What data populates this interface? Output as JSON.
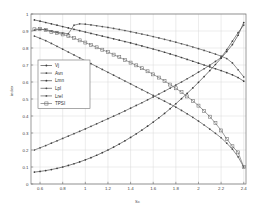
{
  "chart_data": {
    "type": "line",
    "title": "",
    "xlabel": "Sc",
    "ylabel": "index",
    "xlim": [
      0.52,
      2.42
    ],
    "ylim": [
      0,
      1
    ],
    "xticks": [
      0.6,
      0.8,
      1.0,
      1.2,
      1.4,
      1.6,
      1.8,
      2.0,
      2.2,
      2.4
    ],
    "xticklabels": [
      "0.6",
      "0.8",
      "1",
      "1.2",
      "1.4",
      "1.6",
      "1.8",
      "2",
      "2.2",
      "2.4"
    ],
    "yticks": [
      0,
      0.1,
      0.2,
      0.3,
      0.4,
      0.5,
      0.6,
      0.7,
      0.8,
      0.9,
      1
    ],
    "yticklabels": [
      "0",
      "0.1",
      "0.2",
      "0.3",
      "0.4",
      "0.5",
      "0.6",
      "0.7",
      "0.8",
      "0.9",
      "1"
    ],
    "grid": true,
    "legend_position": "upper-left-inside",
    "x": [
      0.55,
      0.6,
      0.65,
      0.7,
      0.75,
      0.8,
      0.85,
      0.9,
      0.95,
      1.0,
      1.05,
      1.1,
      1.15,
      1.2,
      1.25,
      1.3,
      1.35,
      1.4,
      1.45,
      1.5,
      1.55,
      1.6,
      1.65,
      1.7,
      1.75,
      1.8,
      1.85,
      1.9,
      1.95,
      2.0,
      2.05,
      2.1,
      2.15,
      2.2,
      2.25,
      2.3,
      2.35,
      2.4
    ],
    "series": [
      {
        "name": "Vj",
        "marker": "dot",
        "color": "#3a3a3a",
        "values": [
          0.965,
          0.958,
          0.95,
          0.942,
          0.934,
          0.926,
          0.918,
          0.91,
          0.902,
          0.894,
          0.886,
          0.878,
          0.87,
          0.862,
          0.854,
          0.846,
          0.838,
          0.83,
          0.821,
          0.812,
          0.803,
          0.794,
          0.785,
          0.775,
          0.765,
          0.755,
          0.744,
          0.733,
          0.722,
          0.711,
          0.7,
          0.689,
          0.678,
          0.667,
          0.655,
          0.642,
          0.626,
          0.605
        ]
      },
      {
        "name": "Avn",
        "marker": "dot",
        "color": "#4a4a4a",
        "values": [
          0.87,
          0.857,
          0.843,
          0.827,
          0.81,
          0.793,
          0.776,
          0.759,
          0.742,
          0.725,
          0.708,
          0.691,
          0.674,
          0.657,
          0.64,
          0.623,
          0.606,
          0.589,
          0.572,
          0.555,
          0.538,
          0.521,
          0.504,
          0.487,
          0.47,
          0.452,
          0.433,
          0.413,
          0.392,
          0.37,
          0.347,
          0.323,
          0.298,
          0.272,
          0.24,
          0.205,
          0.16,
          0.1
        ]
      },
      {
        "name": "Lmn",
        "marker": "dot",
        "color": "#3a3a3a",
        "values": [
          0.07,
          0.074,
          0.079,
          0.085,
          0.092,
          0.1,
          0.109,
          0.119,
          0.13,
          0.142,
          0.155,
          0.169,
          0.184,
          0.2,
          0.217,
          0.235,
          0.254,
          0.274,
          0.295,
          0.317,
          0.34,
          0.364,
          0.389,
          0.415,
          0.443,
          0.472,
          0.502,
          0.533,
          0.565,
          0.598,
          0.632,
          0.667,
          0.703,
          0.74,
          0.779,
          0.82,
          0.875,
          0.95
        ]
      },
      {
        "name": "Lpl",
        "marker": "dot",
        "color": "#4a4a4a",
        "values": [
          0.2,
          0.213,
          0.226,
          0.24,
          0.254,
          0.268,
          0.282,
          0.296,
          0.31,
          0.324,
          0.339,
          0.354,
          0.369,
          0.384,
          0.399,
          0.414,
          0.43,
          0.446,
          0.462,
          0.478,
          0.495,
          0.512,
          0.529,
          0.546,
          0.564,
          0.582,
          0.6,
          0.619,
          0.638,
          0.658,
          0.678,
          0.699,
          0.721,
          0.744,
          0.79,
          0.84,
          0.89,
          0.935
        ]
      },
      {
        "name": "Lrel",
        "marker": "dot",
        "color": "#505050",
        "values": [
          0.905,
          0.91,
          0.908,
          0.9,
          0.893,
          0.888,
          0.884,
          0.934,
          0.942,
          0.94,
          0.936,
          0.931,
          0.926,
          0.921,
          0.915,
          0.909,
          0.903,
          0.896,
          0.889,
          0.882,
          0.875,
          0.867,
          0.859,
          0.851,
          0.843,
          0.834,
          0.825,
          0.816,
          0.806,
          0.796,
          0.786,
          0.775,
          0.764,
          0.752,
          0.738,
          0.712,
          0.672,
          0.63
        ]
      },
      {
        "name": "TPSI",
        "marker": "square",
        "color": "#6a6a6a",
        "values": [
          0.91,
          0.912,
          0.905,
          0.895,
          0.888,
          0.88,
          0.87,
          0.858,
          0.845,
          0.832,
          0.818,
          0.804,
          0.79,
          0.776,
          0.761,
          0.746,
          0.73,
          0.714,
          0.698,
          0.681,
          0.663,
          0.645,
          0.626,
          0.606,
          0.585,
          0.563,
          0.54,
          0.515,
          0.489,
          0.461,
          0.43,
          0.396,
          0.358,
          0.315,
          0.265,
          0.222,
          0.186,
          0.1
        ]
      }
    ]
  },
  "legend": {
    "entries": [
      {
        "label": "Vj"
      },
      {
        "label": "Avn"
      },
      {
        "label": "Lmn"
      },
      {
        "label": "Lpl"
      },
      {
        "label": "Lrel"
      },
      {
        "label": "TPSI"
      }
    ]
  },
  "colors": {
    "axis": "#6f6f6f",
    "grid": "#d8d8d8",
    "background": "#ffffff",
    "text": "#404040"
  }
}
